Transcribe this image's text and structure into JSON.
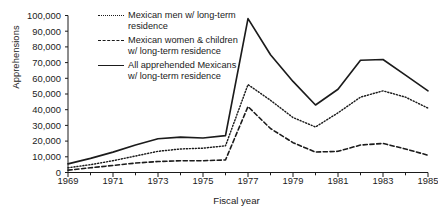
{
  "chart_data": {
    "type": "line",
    "title": "",
    "xlabel": "Fiscal year",
    "ylabel": "Apprehensions",
    "x": [
      1969,
      1970,
      1971,
      1972,
      1973,
      1974,
      1975,
      1976,
      1977,
      1978,
      1979,
      1980,
      1981,
      1982,
      1983,
      1984,
      1985
    ],
    "xlim": [
      1969,
      1985
    ],
    "ylim": [
      0,
      100000
    ],
    "xtick_labels": [
      "1969",
      "1971",
      "1973",
      "1975",
      "1977",
      "1979",
      "1981",
      "1983",
      "1985"
    ],
    "xtick_values": [
      1969,
      1971,
      1973,
      1975,
      1977,
      1979,
      1981,
      1983,
      1985
    ],
    "ytick_labels": [
      "0",
      "10,000",
      "20,000",
      "30,000",
      "40,000",
      "50,000",
      "60,000",
      "70,000",
      "80,000",
      "90,000",
      "100,000"
    ],
    "ytick_values": [
      0,
      10000,
      20000,
      30000,
      40000,
      50000,
      60000,
      70000,
      80000,
      90000,
      100000
    ],
    "grid": false,
    "legend_position": "upper-left-inside",
    "series": [
      {
        "name": "Mexican men w/ long-term residence",
        "style": "dotted",
        "color": "#1b1b1b",
        "values": [
          3000,
          5000,
          7500,
          10500,
          13500,
          15000,
          15500,
          17000,
          56000,
          46000,
          35000,
          29000,
          38000,
          48000,
          52000,
          48000,
          41000
        ]
      },
      {
        "name": "Mexican women & children w/ long-term residence",
        "style": "dashed",
        "color": "#1b1b1b",
        "values": [
          1500,
          3000,
          4500,
          6000,
          7000,
          7500,
          7500,
          8000,
          42000,
          28000,
          19000,
          13000,
          13500,
          17500,
          18500,
          15000,
          11000
        ]
      },
      {
        "name": "All apprehended Mexicans w/ long-term residence",
        "style": "solid",
        "color": "#1b1b1b",
        "values": [
          5500,
          9000,
          13000,
          17500,
          21500,
          22500,
          22000,
          23500,
          98000,
          75000,
          58000,
          43000,
          53000,
          71500,
          72000,
          62000,
          52000
        ]
      }
    ]
  },
  "legend": {
    "items": [
      {
        "style": "dotted",
        "line1": "Mexican men w/ long-term",
        "line2": "residence"
      },
      {
        "style": "dashed",
        "line1": "Mexican women & children",
        "line2": "w/ long-term residence"
      },
      {
        "style": "solid",
        "line1": "All apprehended Mexicans",
        "line2": "w/ long-term residence"
      }
    ]
  }
}
